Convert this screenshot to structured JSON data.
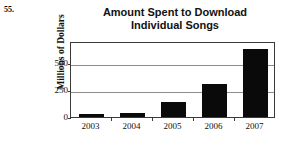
{
  "problem": {
    "number": "55."
  },
  "chart_data": {
    "type": "bar",
    "title": "Amount Spent to Download Individual Songs",
    "title_lines": [
      "Amount Spent to Download",
      "Individual Songs"
    ],
    "xlabel": "",
    "ylabel": "Millions of Dollars",
    "categories": [
      "2003",
      "2004",
      "2005",
      "2006",
      "2007"
    ],
    "values": [
      25,
      35,
      135,
      300,
      630
    ],
    "ylim": [
      0,
      700
    ],
    "yticks": [
      0,
      250,
      500
    ],
    "ytick_labels": [
      "0",
      "250",
      "500"
    ],
    "grid": true,
    "legend": "none",
    "bar_color": "#0a0a0a",
    "frame_color": "#3a3a3a",
    "gridline_color": "#8d8d8d"
  }
}
